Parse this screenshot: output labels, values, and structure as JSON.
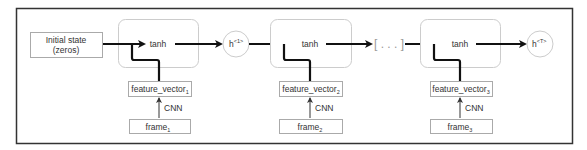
{
  "diagram": {
    "initial_state": {
      "line1": "Initial state",
      "line2": "(zeros)"
    },
    "cells": [
      {
        "op": "tanh",
        "feature": "feature_vector",
        "feature_sub": "1",
        "cnn": "CNN",
        "frame": "frame",
        "frame_sub": "1"
      },
      {
        "op": "tanh",
        "feature": "feature_vector",
        "feature_sub": "2",
        "cnn": "CNN",
        "frame": "frame",
        "frame_sub": "2"
      },
      {
        "op": "tanh",
        "feature": "feature_vector",
        "feature_sub": "3",
        "cnn": "CNN",
        "frame": "frame",
        "frame_sub": "3"
      }
    ],
    "hidden_1": {
      "base": "h",
      "sup": "<1>"
    },
    "ellipsis": "[ . . . ]",
    "hidden_T": {
      "base": "h",
      "sup": "<T>"
    }
  }
}
